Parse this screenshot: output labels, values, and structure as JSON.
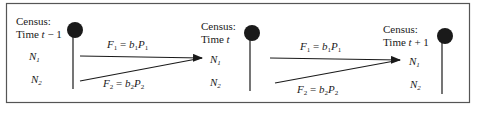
{
  "diagram": {
    "type": "population-census-flow",
    "colors": {
      "ink": "#1a1a1a",
      "frame": "#555555",
      "background": "#ffffff"
    },
    "censuses": [
      {
        "label_line1": "Census:",
        "label_line2_prefix": "Time ",
        "time_var": "t",
        "time_suffix": " − 1",
        "rows": [
          "N",
          "N"
        ],
        "row_subs": [
          "1",
          "2"
        ]
      },
      {
        "label_line1": "Census:",
        "label_line2_prefix": "Time ",
        "time_var": "t",
        "time_suffix": "",
        "rows": [
          "N",
          "N"
        ],
        "row_subs": [
          "1",
          "2"
        ]
      },
      {
        "label_line1": "Census:",
        "label_line2_prefix": "Time ",
        "time_var": "t",
        "time_suffix": " + 1",
        "rows": [
          "N",
          "N"
        ],
        "row_subs": [
          "1",
          "2"
        ]
      }
    ],
    "flows": [
      {
        "f1": {
          "F": "F",
          "Fsub": "1",
          "eq": " = ",
          "b": "b",
          "bsub": "1",
          "P": "P",
          "Psub": "1"
        },
        "f2": {
          "F": "F",
          "Fsub": "2",
          "eq": " = ",
          "b": "b",
          "bsub": "2",
          "P": "P",
          "Psub": "2"
        }
      },
      {
        "f1": {
          "F": "F",
          "Fsub": "1",
          "eq": " = ",
          "b": "b",
          "bsub": "1",
          "P": "P",
          "Psub": "1"
        },
        "f2": {
          "F": "F",
          "Fsub": "2",
          "eq": " = ",
          "b": "b",
          "bsub": "2",
          "P": "P",
          "Psub": "2"
        }
      }
    ]
  }
}
